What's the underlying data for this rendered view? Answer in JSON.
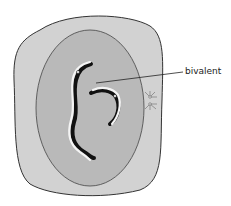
{
  "diagram": {
    "labels": [
      {
        "id": "bivalent",
        "text": "bivalent"
      }
    ],
    "colors": {
      "cytoplasm": "#d2d2d2",
      "nucleus": "#b9b9b9",
      "outline": "#333333",
      "chromatid_dark": "#111111",
      "chromatid_light": "#f4f4f4"
    }
  }
}
